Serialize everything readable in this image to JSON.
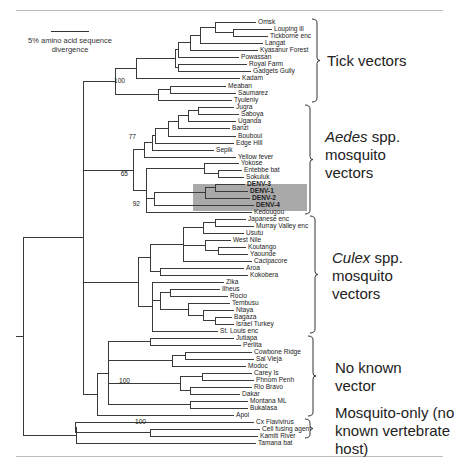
{
  "scale_bar": {
    "label": "5% amino acid sequence divergence"
  },
  "highlight_color": "#a9a9a9",
  "leaves": [
    "Omsk",
    "Louping ill",
    "Tickborne enc",
    "Langat",
    "Kyasanur Forest",
    "Powassan",
    "Royal Farm",
    "Gadgets Gully",
    "Kadam",
    "Meaban",
    "Saumarez",
    "Tyuleniy",
    "Jugra",
    "Saboya",
    "Uganda",
    "Banzi",
    "Bouboui",
    "Edge Hill",
    "Sepik",
    "Yellow fever",
    "Yokose",
    "Entebbe bat",
    "Sokuluk",
    "DENV-3",
    "DENV-1",
    "DENV-2",
    "DENV-4",
    "Kedougou",
    "Japanese enc",
    "Murray Valley enc",
    "Usutu",
    "West Nile",
    "Koutango",
    "Yaounde",
    "Cacipacore",
    "Aroa",
    "Kokobera",
    "Zika",
    "Ilheus",
    "Rocio",
    "Tembusu",
    "Ntaya",
    "Bagaza",
    "Israel Turkey",
    "St. Louis enc",
    "Jutiapa",
    "Perlita",
    "Cowbone Ridge",
    "Sal Vieja",
    "Modoc",
    "Carey Is",
    "Phnom Penh",
    "Rio Bravo",
    "Dakar",
    "Montana ML",
    "Bukalasa",
    "Apoi",
    "Cx Flavivirus",
    "Cell fusing agent",
    "Kamiti River",
    "Tamana bat"
  ],
  "bootstrap_values": [
    "100",
    "77",
    "65",
    "92",
    "100",
    "100"
  ],
  "groups": [
    {
      "id": "tick",
      "label_plain": "Tick vectors"
    },
    {
      "id": "aedes",
      "label_italic": "Aedes",
      "label_rest": " spp.",
      "label_line2": "mosquito",
      "label_line3": "vectors"
    },
    {
      "id": "culex",
      "label_italic": "Culex",
      "label_rest": " spp.",
      "label_line2": "mosquito",
      "label_line3": "vectors"
    },
    {
      "id": "noknown",
      "label_line1": "No known",
      "label_line2": "vector"
    },
    {
      "id": "mosqonly",
      "label_line1": "Mosquito-only (no",
      "label_line2": "known vertebrate",
      "label_line3": "host)"
    }
  ]
}
